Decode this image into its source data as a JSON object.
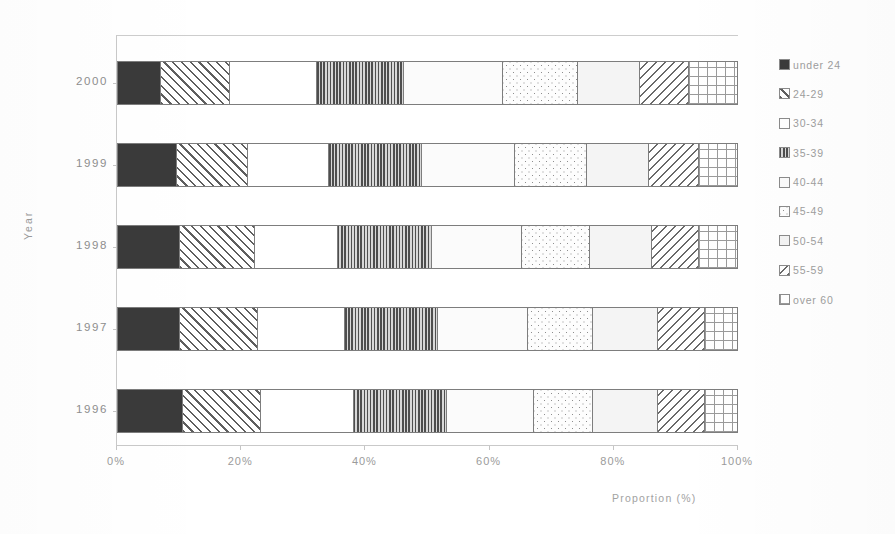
{
  "chart_data": {
    "type": "bar",
    "orientation": "horizontal",
    "stacked": true,
    "normalized": true,
    "title": "",
    "xlabel": "Proportion (%)",
    "ylabel": "Year",
    "xlim": [
      0,
      100
    ],
    "xticks": [
      0,
      20,
      40,
      60,
      80,
      100
    ],
    "xtick_labels": [
      "0%",
      "20%",
      "40%",
      "60%",
      "80%",
      "100%"
    ],
    "grid": false,
    "legend_position": "right",
    "categories": [
      "2000",
      "1999",
      "1998",
      "1997",
      "1996"
    ],
    "series": [
      {
        "name": "under 24",
        "pattern": "solid-dark",
        "values": [
          7.0,
          9.5,
          10.0,
          10.0,
          10.5
        ]
      },
      {
        "name": "24-29",
        "pattern": "diagonal-hatch-fw",
        "values": [
          11.0,
          11.5,
          12.0,
          12.5,
          12.5
        ]
      },
      {
        "name": "30-34",
        "pattern": "white",
        "values": [
          14.0,
          13.0,
          13.5,
          14.0,
          15.0
        ]
      },
      {
        "name": "35-39",
        "pattern": "vertical-lines",
        "values": [
          14.0,
          15.0,
          15.0,
          15.0,
          15.0
        ]
      },
      {
        "name": "40-44",
        "pattern": "white-light",
        "values": [
          16.0,
          15.0,
          14.5,
          14.5,
          14.0
        ]
      },
      {
        "name": "45-49",
        "pattern": "sparse-dots",
        "values": [
          12.0,
          11.5,
          11.0,
          10.5,
          9.5
        ]
      },
      {
        "name": "50-54",
        "pattern": "pale-flat",
        "values": [
          10.0,
          10.0,
          10.0,
          10.5,
          10.5
        ]
      },
      {
        "name": "55-59",
        "pattern": "diagonal-hatch-bw",
        "values": [
          8.0,
          8.0,
          7.5,
          7.5,
          7.5
        ]
      },
      {
        "name": "over 60",
        "pattern": "cross-grid",
        "values": [
          8.0,
          6.5,
          6.5,
          5.5,
          5.5
        ]
      }
    ]
  },
  "axes": {
    "y_title": "Year",
    "x_title": "Proportion (%)",
    "y_categories": [
      "2000",
      "1999",
      "1998",
      "1997",
      "1996"
    ],
    "x_tick_labels": [
      "0%",
      "20%",
      "40%",
      "60%",
      "80%",
      "100%"
    ]
  },
  "legend": {
    "items": [
      {
        "label": "under 24"
      },
      {
        "label": "24-29"
      },
      {
        "label": "30-34"
      },
      {
        "label": "35-39"
      },
      {
        "label": "40-44"
      },
      {
        "label": "45-49"
      },
      {
        "label": "50-54"
      },
      {
        "label": "55-59"
      },
      {
        "label": "over 60"
      }
    ]
  },
  "colors": {
    "ink": "#3a3a3a",
    "outline": "#7d7d7d",
    "axis": "#c9c9c9",
    "text": "#9a9a9a",
    "background": "#ffffff"
  }
}
